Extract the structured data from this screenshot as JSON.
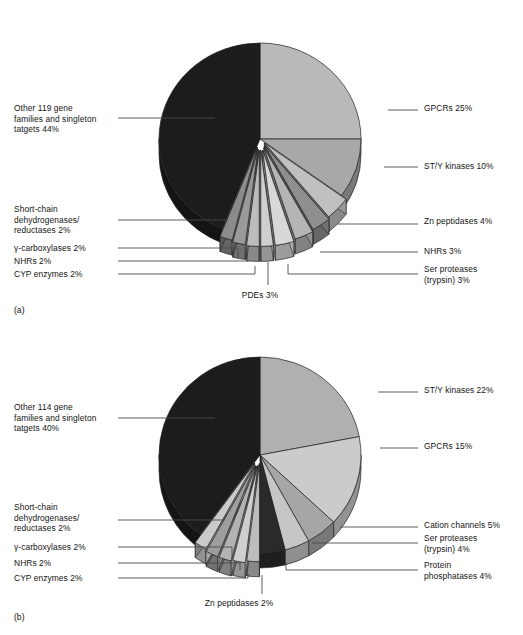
{
  "figure": {
    "panel_a_tag": "(a)",
    "panel_b_tag": "(b)"
  },
  "chart_data": [
    {
      "type": "pie",
      "id": "a",
      "title": "",
      "legend_position": "callout-labels",
      "grid": false,
      "note": "3D exploded pie of drug target gene families, panel (a)",
      "categories": [
        "GPCRs",
        "ST/Y kinases",
        "Zn peptidases",
        "NHRs",
        "Ser proteases (trypsin)",
        "PDEs",
        "CYP enzymes",
        "NHRs",
        "γ-carboxylases",
        "Short-chain dehydrogenases/reductases",
        "Other 119 gene families and singleton tatgets"
      ],
      "values": [
        25,
        10,
        4,
        3,
        3,
        3,
        2,
        2,
        2,
        2,
        44
      ],
      "labels": [
        "GPCRs 25%",
        "ST/Y kinases 10%",
        "Zn peptidases 4%",
        "NHRs 3%",
        "Ser proteases\n(trypsin) 3%",
        "PDEs 3%",
        "CYP enzymes 2%",
        "NHRs 2%",
        "γ-carboxylases 2%",
        "Short-chain\ndehydrogenases/\nreductases 2%",
        "Other 119 gene\nfamilies and singleton\ntatgets 44%"
      ],
      "colors": [
        "#b9b9b9",
        "#a8a8a8",
        "#c0c0c0",
        "#8f8f8f",
        "#b5b5b5",
        "#d8d8d8",
        "#cfcfcf",
        "#bdbdbd",
        "#9a9a9a",
        "#8b8b8b",
        "#1c1c1c"
      ],
      "total": 100,
      "xlabel": "",
      "ylabel": ""
    },
    {
      "type": "pie",
      "id": "b",
      "title": "",
      "legend_position": "callout-labels",
      "grid": false,
      "note": "3D exploded pie of drug target gene families, panel (b)",
      "categories": [
        "ST/Y kinases",
        "GPCRs",
        "Cation channels",
        "Ser proteases (trypsin)",
        "Protein phosphatases",
        "Zn peptidases",
        "CYP enzymes",
        "NHRs",
        "γ-carboxylases",
        "Short-chain dehydrogenases/reductases",
        "Other 114 gene families and singleton tatgets"
      ],
      "values": [
        22,
        15,
        5,
        4,
        4,
        2,
        2,
        2,
        2,
        2,
        40
      ],
      "labels": [
        "ST/Y kinases 22%",
        "GPCRs 15%",
        "Cation channels 5%",
        "Ser proteases\n(trypsin) 4%",
        "Protein\nphosphatases 4%",
        "Zn peptidases 2%",
        "CYP enzymes 2%",
        "NHRs 2%",
        "γ-carboxylases 2%",
        "Short-chain\ndehydrogenases/\nreductases 2%",
        "Other 114 gene\nfamilies and singleton\ntatgets 40%"
      ],
      "colors": [
        "#b0b0b0",
        "#cbcbcb",
        "#a6a6a6",
        "#c6c6c6",
        "#2a2a2a",
        "#bdbdbd",
        "#cfcfcf",
        "#b3b3b3",
        "#9e9e9e",
        "#cacaca",
        "#1c1c1c"
      ],
      "total": 100,
      "xlabel": "",
      "ylabel": ""
    }
  ],
  "panel_a": {
    "labels": {
      "other": "Other 119 gene\nfamilies and singleton\ntatgets 44%",
      "short_chain": "Short-chain\ndehydrogenases/\nreductases 2%",
      "carboxylases": "γ-carboxylases 2%",
      "nhrs_left": "NHRs 2%",
      "cyp": "CYP enzymes 2%",
      "pdes": "PDEs 3%",
      "gpcrs": "GPCRs 25%",
      "kinases": "ST/Y kinases 10%",
      "zn_peptidases": "Zn peptidases 4%",
      "nhrs_right": "NHRs 3%",
      "ser_proteases": "Ser proteases\n(trypsin) 3%"
    }
  },
  "panel_b": {
    "labels": {
      "other": "Other 114 gene\nfamilies and singleton\ntatgets 40%",
      "short_chain": "Short-chain\ndehydrogenases/\nreductases 2%",
      "carboxylases": "γ-carboxylases 2%",
      "nhrs_left": "NHRs 2%",
      "cyp": "CYP enzymes 2%",
      "zn_peptidases": "Zn peptidases 2%",
      "kinases": "ST/Y kinases 22%",
      "gpcrs": "GPCRs 15%",
      "cation_channels": "Cation channels 5%",
      "ser_proteases": "Ser proteases\n(trypsin) 4%",
      "protein_phosphatases": "Protein\nphosphatases 4%"
    }
  }
}
